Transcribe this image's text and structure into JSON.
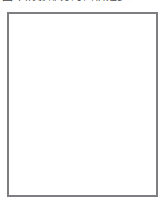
{
  "caption": {
    "text": "图中阴影部分的面积是多少？",
    "visible_fragment": "partially-cropped-cjk-text-row"
  },
  "figure": {
    "frame": {
      "x": 8,
      "y": 4,
      "width": 149,
      "height": 183,
      "stroke": "#7d7d82"
    },
    "grid": {
      "cell_size": 12.4,
      "columns": 12,
      "rows": 15,
      "color": "#c9c9cc",
      "visible": true
    },
    "curve_color": "#4a4a50",
    "points": [
      {
        "id": "A",
        "label": "A",
        "cx": 35,
        "cy": 97,
        "dot_radius": 2.5,
        "label_dx": 4,
        "label_dy": 11
      },
      {
        "id": "B",
        "label": "B",
        "cx": 131,
        "cy": 97,
        "dot_radius": 2.5,
        "label_dx": 4,
        "label_dy": 11
      }
    ],
    "circles": [
      {
        "center": "A",
        "cx": 35,
        "cy": 97,
        "r": 84
      },
      {
        "center": "B",
        "cx": 131,
        "cy": 97,
        "r": 84
      }
    ],
    "intersections": [
      {
        "x": 83,
        "y": 38
      },
      {
        "x": 83,
        "y": 156
      }
    ]
  },
  "chart_data": {
    "type": "scatter",
    "xlabel": "",
    "ylabel": "",
    "grid": true,
    "legend": "none",
    "xlim": [
      0,
      12
    ],
    "ylim": [
      0,
      15
    ],
    "categories": [
      "A",
      "B"
    ],
    "series": [
      {
        "name": "centers",
        "points": [
          {
            "label": "A",
            "x": 2.2,
            "y": 7.5
          },
          {
            "label": "B",
            "x": 9.9,
            "y": 7.5
          }
        ]
      },
      {
        "name": "circle-A",
        "shape": "circle",
        "center": [
          2.2,
          7.5
        ],
        "radius": 6.8
      },
      {
        "name": "circle-B",
        "shape": "circle",
        "center": [
          9.9,
          7.5
        ],
        "radius": 6.8
      }
    ],
    "annotations": [
      {
        "text": "A",
        "x": 2.2,
        "y": 7.5
      },
      {
        "text": "B",
        "x": 9.9,
        "y": 7.5
      }
    ]
  }
}
